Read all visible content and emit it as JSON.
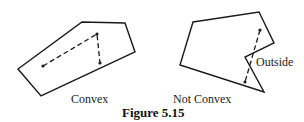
{
  "figure": {
    "caption": "Figure 5.15",
    "panels": [
      {
        "label": "Convex",
        "polygon": [
          [
            18,
            69
          ],
          [
            82,
            22
          ],
          [
            125,
            23
          ],
          [
            135,
            52
          ],
          [
            41,
            96
          ]
        ],
        "segment": {
          "from": [
            43,
            66
          ],
          "via": [
            97,
            34
          ],
          "to": [
            100,
            63
          ],
          "style": "dashed"
        }
      },
      {
        "label": "Not Convex",
        "polygon": [
          [
            193,
            22
          ],
          [
            259,
            12
          ],
          [
            274,
            43
          ],
          [
            245,
            57
          ],
          [
            264,
            92
          ],
          [
            180,
            65
          ]
        ],
        "segment": {
          "from": [
            260,
            30
          ],
          "to": [
            245,
            82
          ],
          "style": "dashed"
        },
        "annotation": "Outside"
      }
    ]
  },
  "colors": {
    "stroke": "#1a1a1a",
    "background": "#ffffff"
  }
}
